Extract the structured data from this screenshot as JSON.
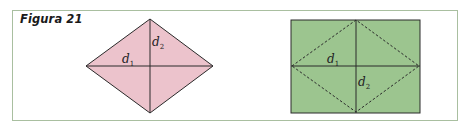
{
  "figure": {
    "title": "Figura 21"
  },
  "colors": {
    "frame_border": "#a9bfa0",
    "rhombus_fill": "#ecc3cc",
    "rectangle_fill": "#9cc58f",
    "line": "#2a2a2a"
  },
  "left_figure": {
    "shape": "rhombus",
    "diagonal_labels": {
      "d1": {
        "base": "d",
        "sub": "1"
      },
      "d2": {
        "base": "d",
        "sub": "2"
      }
    }
  },
  "right_figure": {
    "shape": "rectangle with inscribed dashed rhombus",
    "diagonal_labels": {
      "d1": {
        "base": "d",
        "sub": "1"
      },
      "d2": {
        "base": "d",
        "sub": "2"
      }
    }
  }
}
